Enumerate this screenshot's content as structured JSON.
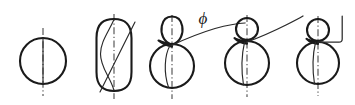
{
  "figure": {
    "background_color": "#ffffff",
    "line_color": "#1a1a1a",
    "thin_line_color": "#2a2a2a",
    "axis_color": "#4a4a4a",
    "width": 355,
    "height": 105,
    "annotations": [
      {
        "name": "phi-angle-label",
        "text": "ϕ",
        "x": 203,
        "y": 24
      }
    ],
    "stages": [
      {
        "index": 1,
        "name": "stage-circle",
        "shape": "circle",
        "cx": 43,
        "cy": 61,
        "r": 23,
        "has_centerline": true,
        "has_chord": true,
        "has_leader": false
      },
      {
        "index": 2,
        "name": "stage-stadium",
        "shape": "stadium",
        "cx": 114,
        "cy": 55,
        "rx": 18,
        "top": 19,
        "bottom": 91,
        "has_centerline": true,
        "has_s_curve": true,
        "has_diagonal": true,
        "has_leader": false
      },
      {
        "index": 3,
        "name": "stage-teardrop-over-circle",
        "shape": "circle-with-oval-cusp",
        "cx": 172,
        "cy": 66,
        "r": 22,
        "small_cx": 172,
        "small_cy": 30,
        "small_rx": 11,
        "small_ry": 14,
        "has_centerline": true,
        "has_chord": true,
        "has_leader": true
      },
      {
        "index": 4,
        "name": "stage-circle-over-circle-a",
        "shape": "circle-with-circle-cusp",
        "cx": 247,
        "cy": 63,
        "r": 22,
        "small_cx": 247,
        "small_cy": 29,
        "small_r": 11,
        "has_centerline": true,
        "has_chord": true,
        "has_leader": true
      },
      {
        "index": 5,
        "name": "stage-circle-over-circle-b",
        "shape": "circle-with-circle-cusp",
        "cx": 318,
        "cy": 63,
        "r": 21,
        "small_cx": 318,
        "small_cy": 30,
        "small_r": 11,
        "has_centerline": true,
        "has_chord": true,
        "has_leader": true,
        "leader_style": "right-angle"
      }
    ]
  }
}
